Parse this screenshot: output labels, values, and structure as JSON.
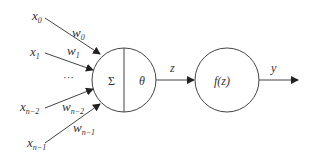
{
  "diagram": {
    "type": "perceptron",
    "inputs": [
      {
        "var": "x",
        "sub": "0",
        "weight": "w",
        "weight_sub": "0"
      },
      {
        "var": "x",
        "sub": "1",
        "weight": "w",
        "weight_sub": "1"
      },
      {
        "var": "x",
        "sub": "n−2",
        "weight": "w",
        "weight_sub": "n−2"
      },
      {
        "var": "x",
        "sub": "n−1",
        "weight": "w",
        "weight_sub": "n−1"
      }
    ],
    "ellipsis": "···",
    "summation_node": {
      "left_label": "Σ",
      "right_label": "θ"
    },
    "edge_z_label": "z",
    "activation_node": {
      "label": "f(z)"
    },
    "output_label": "y"
  }
}
